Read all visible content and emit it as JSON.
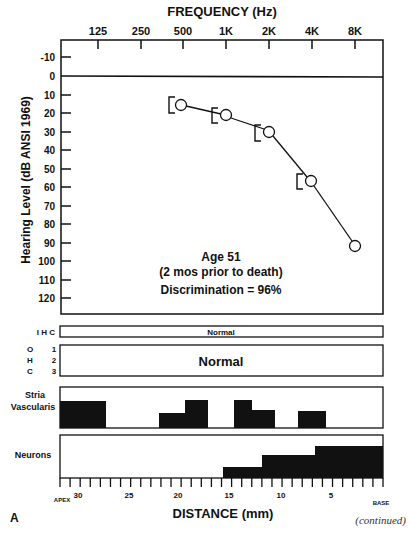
{
  "chart_data": [
    {
      "type": "line",
      "title": "FREQUENCY (Hz)",
      "xlabel": "FREQUENCY (Hz)",
      "ylabel": "Hearing Level (dB ANSI 1969)",
      "x_ticks": [
        "125",
        "250",
        "500",
        "1K",
        "2K",
        "4K",
        "8K"
      ],
      "y_ticks": [
        "-10",
        "0",
        "10",
        "20",
        "30",
        "40",
        "50",
        "60",
        "70",
        "80",
        "90",
        "100",
        "110",
        "120"
      ],
      "ylim": [
        -10,
        120
      ],
      "y_inverted": true,
      "grid": false,
      "series": [
        {
          "name": "Air conduction (O)",
          "x": [
            "500",
            "1K",
            "2K",
            "4K",
            "8K"
          ],
          "values": [
            15,
            20,
            30,
            55,
            90
          ],
          "marker": "circle"
        },
        {
          "name": "Bone conduction ([)",
          "x": [
            "500",
            "1K",
            "2K",
            "4K"
          ],
          "values": [
            15,
            20,
            30,
            55
          ],
          "marker": "left-bracket"
        }
      ],
      "annotations": [
        "Age 51",
        "(2 mos prior to death)",
        "Discrimination = 96%"
      ]
    },
    {
      "type": "bar",
      "title": "Cochleogram",
      "xlabel": "DISTANCE (mm)",
      "x_range_mm": [
        32,
        0
      ],
      "x_ticks": [
        "30",
        "25",
        "20",
        "15",
        "10",
        "5"
      ],
      "x_end_labels": {
        "left": "APEX",
        "right": "BASE"
      },
      "rows": [
        {
          "name": "IHC",
          "status": "Normal"
        },
        {
          "name": "OHC 1-3",
          "status": "Normal"
        },
        {
          "name": "Stria Vascularis",
          "segments_loss_fraction": [
            {
              "from_mm": 32,
              "to_mm": 27,
              "level": 0.65
            },
            {
              "from_mm": 22,
              "to_mm": 19.5,
              "level": 0.35
            },
            {
              "from_mm": 19.5,
              "to_mm": 17,
              "level": 0.7
            },
            {
              "from_mm": 15,
              "to_mm": 13,
              "level": 0.7
            },
            {
              "from_mm": 13,
              "to_mm": 10.5,
              "level": 0.45
            },
            {
              "from_mm": 8,
              "to_mm": 5.5,
              "level": 0.42
            }
          ]
        },
        {
          "name": "Neurons",
          "segments_loss_fraction": [
            {
              "from_mm": 16,
              "to_mm": 12,
              "level": 0.27
            },
            {
              "from_mm": 12,
              "to_mm": 7,
              "level": 0.55
            },
            {
              "from_mm": 7,
              "to_mm": 0,
              "level": 0.75
            }
          ]
        }
      ]
    }
  ],
  "audiogram": {
    "title": "FREQUENCY (Hz)",
    "ylabel": "Hearing Level  (dB ANSI 1969)",
    "freq_labels": [
      "125",
      "250",
      "500",
      "1K",
      "2K",
      "4K",
      "8K"
    ],
    "db_labels": [
      "-10",
      "0",
      "10",
      "20",
      "30",
      "40",
      "50",
      "60",
      "70",
      "80",
      "90",
      "100",
      "110",
      "120"
    ],
    "annotation": {
      "line1": "Age 51",
      "line2": "(2 mos prior to death)",
      "line3": "Discrimination = 96%"
    }
  },
  "cochleogram": {
    "ihc_label": "I H C",
    "ihc_status": "Normal",
    "ohc_letters": [
      "O",
      "H",
      "C"
    ],
    "ohc_rows": [
      "1",
      "2",
      "3"
    ],
    "ohc_status": "Normal",
    "stria_label_1": "Stria",
    "stria_label_2": "Vascularis",
    "neurons_label": "Neurons",
    "distance_ticks": [
      "30",
      "25",
      "20",
      "15",
      "10",
      "5"
    ],
    "apex_label": "APEX",
    "base_label": "BASE",
    "xlabel": "DISTANCE (mm)"
  },
  "footer": {
    "panel_letter": "A",
    "continued": "(continued)"
  },
  "colors": {
    "ink": "#111111",
    "background": "#ffffff"
  }
}
